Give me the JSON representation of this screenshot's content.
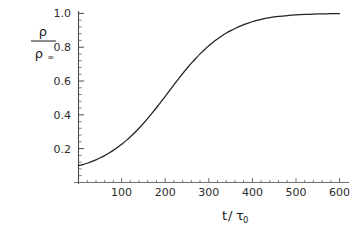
{
  "chart_data": {
    "type": "line",
    "title": "",
    "subtitle": "",
    "xlabel": "t/τ0",
    "xlabel_parts": {
      "numerator": "t",
      "slash": "/",
      "denominator": "τ",
      "denominator_sub": "0"
    },
    "ylabel": "ρ/ρ∞",
    "ylabel_parts": {
      "numerator": "ρ",
      "denominator": "ρ",
      "denominator_sub": "∞"
    },
    "xlim": [
      0,
      620
    ],
    "ylim": [
      0,
      1.06
    ],
    "xticks": [
      100,
      200,
      300,
      400,
      500,
      600
    ],
    "xtick_labels": [
      "100",
      "200",
      "300",
      "400",
      "500",
      "600"
    ],
    "yticks": [
      0.2,
      0.4,
      0.6,
      0.8,
      1.0
    ],
    "ytick_labels": [
      "0.2",
      "0.4",
      "0.6",
      "0.8",
      "1.0"
    ],
    "xminor_count": 4,
    "yminor_count": 4,
    "grid": false,
    "legend": null,
    "legend_position": "none",
    "annotations": [],
    "series": [
      {
        "name": "density ratio",
        "color": "#232323",
        "x": [
          0,
          10,
          20,
          30,
          40,
          50,
          60,
          70,
          80,
          90,
          100,
          110,
          120,
          130,
          140,
          150,
          160,
          170,
          180,
          190,
          200,
          210,
          220,
          230,
          240,
          250,
          260,
          270,
          280,
          290,
          300,
          310,
          320,
          330,
          340,
          350,
          360,
          370,
          380,
          390,
          400,
          410,
          420,
          440,
          460,
          480,
          500,
          520,
          540,
          560,
          580,
          600
        ],
        "y": [
          0.1,
          0.106,
          0.114,
          0.123,
          0.134,
          0.146,
          0.159,
          0.174,
          0.19,
          0.208,
          0.228,
          0.249,
          0.272,
          0.297,
          0.324,
          0.352,
          0.382,
          0.413,
          0.445,
          0.478,
          0.512,
          0.546,
          0.58,
          0.613,
          0.646,
          0.677,
          0.707,
          0.735,
          0.762,
          0.787,
          0.81,
          0.831,
          0.85,
          0.868,
          0.884,
          0.898,
          0.911,
          0.923,
          0.934,
          0.943,
          0.952,
          0.959,
          0.965,
          0.975,
          0.982,
          0.987,
          0.991,
          0.994,
          0.996,
          0.997,
          0.998,
          0.999
        ]
      }
    ],
    "axes_color": "#6e6e6e",
    "text_color": "#1a1a1a",
    "background": "#ffffff"
  }
}
